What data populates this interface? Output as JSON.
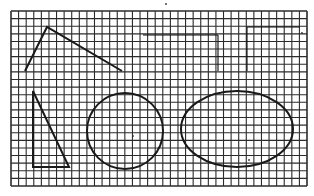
{
  "diagram": {
    "background": "#ffffff",
    "ink_color": "#1a1a1a",
    "grid": {
      "x0": 11,
      "y0": 11,
      "x1": 307,
      "y1": 186,
      "cols": 39,
      "rows": 23,
      "line_color": "#2b2b2b"
    },
    "shapes": [
      {
        "type": "polyline",
        "name": "open-angle",
        "points": [
          [
            25,
            71
          ],
          [
            47,
            27
          ],
          [
            122,
            71
          ]
        ]
      },
      {
        "type": "polygon",
        "name": "right-triangle",
        "points": [
          [
            33,
            91
          ],
          [
            33,
            167
          ],
          [
            69,
            167
          ]
        ]
      },
      {
        "type": "circle",
        "name": "circle",
        "cx": 125,
        "cy": 131,
        "r": 38
      },
      {
        "type": "ellipse",
        "name": "ellipse",
        "cx": 237,
        "cy": 129,
        "rx": 56,
        "ry": 38
      }
    ],
    "faint_segments": [
      [
        [
          143,
          35
        ],
        [
          218,
          35
        ]
      ],
      [
        [
          218,
          35
        ],
        [
          218,
          71
        ]
      ],
      [
        [
          247,
          27
        ],
        [
          300,
          27
        ]
      ],
      [
        [
          247,
          27
        ],
        [
          247,
          71
        ]
      ]
    ],
    "dots": [
      [
        133,
        136
      ],
      [
        249,
        160
      ],
      [
        302,
        33
      ],
      [
        166,
        4
      ]
    ]
  }
}
